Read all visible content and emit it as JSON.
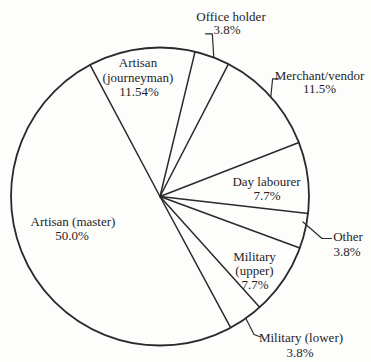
{
  "figure": {
    "background_color": "#fdfdfc",
    "line_color": "#2a2a2a",
    "text_color": "#1f1f1f"
  },
  "chart_data": {
    "type": "pie",
    "title": "",
    "legend": "none",
    "fill_style": "unfilled-outline",
    "start_angle_deg": -28,
    "direction": "clockwise",
    "slices": [
      {
        "label": "Artisan (journeyman)",
        "label_lines": [
          "Artisan",
          "(journeyman)"
        ],
        "value": 11.54,
        "pct_label": "11.54%",
        "label_placement": "inside"
      },
      {
        "label": "Office holder",
        "value": 3.8,
        "pct_label": "3.8%",
        "label_placement": "outside"
      },
      {
        "label": "Merchant/vendor",
        "value": 11.5,
        "pct_label": "11.5%",
        "label_placement": "outside"
      },
      {
        "label": "Day labourer",
        "value": 7.7,
        "pct_label": "7.7%",
        "label_placement": "inside"
      },
      {
        "label": "Other",
        "value": 3.8,
        "pct_label": "3.8%",
        "label_placement": "outside"
      },
      {
        "label": "Military (upper)",
        "label_lines": [
          "Military",
          "(upper)"
        ],
        "value": 7.7,
        "pct_label": "7.7%",
        "label_placement": "inside"
      },
      {
        "label": "Military (lower)",
        "value": 3.8,
        "pct_label": "3.8%",
        "label_placement": "outside"
      },
      {
        "label": "Artisan (master)",
        "value": 50.0,
        "pct_label": "50.0%",
        "label_placement": "inside"
      }
    ]
  }
}
